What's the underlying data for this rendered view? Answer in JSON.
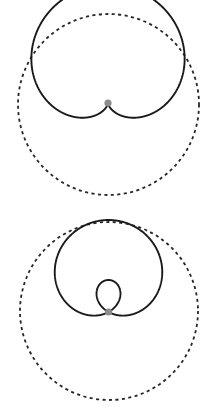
{
  "page": {
    "background_color": "#ffffff",
    "width": 219,
    "height": 414
  },
  "style": {
    "solid_curve_color": "#1a1a1a",
    "dashed_curve_color": "#262626",
    "node_dot_color": "#8c8c8c",
    "solid_stroke_width": 1.9,
    "dashed_stroke_width": 1.8,
    "dash_pattern": "3.1 3.4"
  },
  "figures": [
    {
      "id": "cardioid",
      "name": "cardioid",
      "panel_top": 0,
      "pole": {
        "x": 108,
        "y": 103
      },
      "dashed_circle": {
        "cx": 108.5,
        "cy": 104.5,
        "r": 90.5
      },
      "curve": {
        "type": "limacon",
        "equation": "r = a(1 - cos(theta))",
        "a": 59,
        "b": 59,
        "ratio_b_over_a": 1,
        "orientation": "cusp-down",
        "rotation_deg": -90,
        "cusp": {
          "x": 108,
          "y": 103
        },
        "extent": {
          "left": 49,
          "right": 167,
          "top": 14,
          "bottom": 103
        },
        "width": 118,
        "height": 89,
        "has_inner_loop": false
      },
      "node_dot": {
        "x": 108,
        "y": 103,
        "r": 3.6
      }
    },
    {
      "id": "limacon-with-inner-loop",
      "name": "limacon with inner loop",
      "panel_top": 207,
      "pole": {
        "x": 108.5,
        "y": 312
      },
      "dashed_circle": {
        "cx": 109,
        "cy": 311,
        "r": 89
      },
      "curve": {
        "type": "limacon",
        "equation": "r = b + a*cos(theta)",
        "a": 62,
        "b": 30,
        "ratio_b_over_a": 0.484,
        "orientation": "outer-loop-up",
        "rotation_deg": -90,
        "node": {
          "x": 108.5,
          "y": 312
        },
        "outer_loop": {
          "left": 55,
          "right": 163,
          "top": 222,
          "bottom": 312
        },
        "inner_loop": {
          "left": 79,
          "right": 139,
          "top": 312,
          "bottom": 377
        },
        "has_inner_loop": true
      },
      "node_dot": {
        "x": 108.5,
        "y": 312,
        "r": 3.6
      }
    }
  ],
  "chart_data": {
    "type": "line",
    "xlabel": "",
    "ylabel": "",
    "grid": false,
    "legend_position": "none",
    "coordinate_system": "polar",
    "series": [
      {
        "name": "cardioid",
        "equation": "r = a(1 - cos(theta))",
        "style": "solid",
        "a": 59,
        "b": 59,
        "samples_theta_deg": [
          0,
          30,
          60,
          90,
          120,
          150,
          180,
          210,
          240,
          270,
          300,
          330,
          360
        ],
        "samples_r": [
          0,
          7.9,
          29.5,
          59,
          88.5,
          110.1,
          118,
          110.1,
          88.5,
          59,
          29.5,
          7.9,
          0
        ]
      },
      {
        "name": "reference circle (cardioid)",
        "equation": "r = 90.5",
        "style": "dashed",
        "radius": 90.5
      },
      {
        "name": "limacon with inner loop",
        "equation": "r = b + a*cos(theta)",
        "style": "solid",
        "a": 62,
        "b": 30,
        "samples_theta_deg": [
          0,
          30,
          60,
          90,
          120,
          150,
          180,
          210,
          240,
          270,
          300,
          330,
          360
        ],
        "samples_r": [
          92,
          83.7,
          61,
          30,
          -1,
          -23.7,
          -32,
          -23.7,
          -1,
          30,
          61,
          83.7,
          92
        ]
      },
      {
        "name": "reference circle (limacon)",
        "equation": "r = 89",
        "style": "dashed",
        "radius": 89
      }
    ]
  }
}
